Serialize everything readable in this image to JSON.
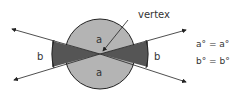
{
  "diagram": {
    "labels": {
      "vertex": "vertex",
      "angle_a_top": "a",
      "angle_a_bottom": "a",
      "angle_b_left": "b",
      "angle_b_right": "b"
    },
    "equations": [
      "a° = a°",
      "b° = b°"
    ],
    "colors": {
      "light_sector": "#b4b4b4",
      "dark_sector": "#555555",
      "outline": "#222222",
      "background": "#ffffff"
    }
  }
}
